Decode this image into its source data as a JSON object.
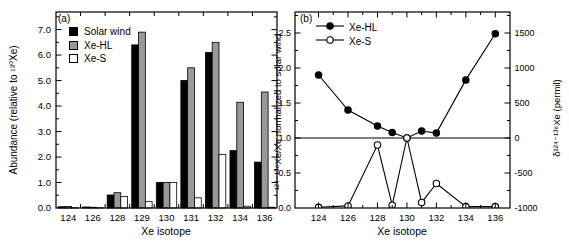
{
  "figure": {
    "background": "#ffffff",
    "frame_color": "#000000",
    "bar_gray": "#999999"
  },
  "chart_data": [
    {
      "id": "panel_a",
      "type": "bar",
      "panel_label": "(a)",
      "xlabel": "Xe isotope",
      "ylabel": "Abundance (relative to ¹³⁰Xe)",
      "categories": [
        "124",
        "126",
        "128",
        "129",
        "130",
        "131",
        "132",
        "134",
        "136"
      ],
      "series": [
        {
          "name": "Solar wind",
          "fill": "#000000",
          "values": [
            0.05,
            0.04,
            0.51,
            6.4,
            1.0,
            5.0,
            6.1,
            2.25,
            1.8
          ]
        },
        {
          "name": "Xe-HL",
          "fill": "#999999",
          "values": [
            0.06,
            0.03,
            0.6,
            6.9,
            1.0,
            5.5,
            6.5,
            4.15,
            4.55
          ]
        },
        {
          "name": "Xe-S",
          "fill": "#ffffff",
          "values": [
            0.01,
            0.01,
            0.45,
            0.25,
            1.0,
            0.4,
            2.1,
            0.07,
            0.03
          ]
        }
      ],
      "ylim": [
        0,
        7.69
      ],
      "yticks": [
        0,
        1,
        2,
        3,
        4,
        5,
        6,
        7
      ],
      "ytick_labels": [
        "0.0",
        "1.0",
        "2.0",
        "3.0",
        "4.0",
        "5.0",
        "6.0",
        "7.0"
      ],
      "minor_y_step": 0.5,
      "grid": false,
      "legend_position": "top-left"
    },
    {
      "id": "panel_b",
      "type": "line",
      "panel_label": "(b)",
      "xlabel": "Xe isotope",
      "ylabel_left": "¹²⁴⁻¹³⁶Xe/Xe normalized to solar wind",
      "ylabel_right": "δ¹²⁴⁻¹³⁶Xe (permil)",
      "x": [
        124,
        126,
        128,
        129,
        130,
        131,
        132,
        134,
        136
      ],
      "series": [
        {
          "name": "Xe-HL",
          "marker": "filled-circle",
          "color": "#000000",
          "values": [
            1.9,
            1.4,
            1.17,
            1.08,
            1.0,
            1.1,
            1.07,
            1.83,
            2.49
          ]
        },
        {
          "name": "Xe-S",
          "marker": "open-circle",
          "color": "#000000",
          "values": [
            0.01,
            0.03,
            0.9,
            0.04,
            1.0,
            0.08,
            0.35,
            0.02,
            0.02
          ]
        }
      ],
      "xlim": [
        122.4,
        137.0
      ],
      "ylim_left": [
        0,
        2.8
      ],
      "xticks": [
        124,
        126,
        128,
        130,
        132,
        134,
        136
      ],
      "minor_xticks": [
        125,
        127,
        129,
        131,
        133,
        135
      ],
      "yticks_left": [
        0,
        0.5,
        1.0,
        1.5,
        2.0,
        2.5
      ],
      "ytick_labels_left": [
        "0.0",
        "0.5",
        "1.0",
        "1.5",
        "2.0",
        "2.5"
      ],
      "yticks_right_labels": [
        "-1000",
        "-500",
        "0",
        "500",
        "1000",
        "1500"
      ],
      "yticks_right_values_permil": [
        -1000,
        -500,
        0,
        500,
        1000,
        1500
      ],
      "minor_y_step": 0.25,
      "reference_line_y": 1.0,
      "grid": false,
      "legend_position": "top-left"
    }
  ]
}
